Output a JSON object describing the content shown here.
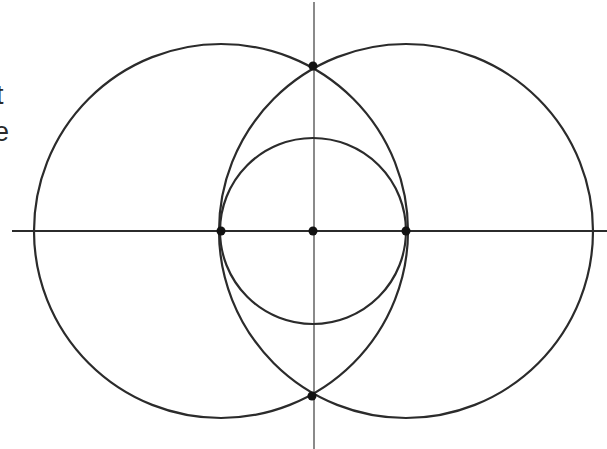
{
  "fragments": {
    "line1": "t",
    "line2": "e"
  },
  "colors": {
    "stroke": "#2b2b2b",
    "axis_vertical": "#8a8a8a",
    "point": "#111111",
    "background": "#ffffff"
  },
  "geometry": {
    "horizontal_axis": {
      "x1": 12,
      "y1": 231,
      "x2": 607,
      "y2": 231
    },
    "vertical_axis": {
      "x1": 314,
      "y1": 2,
      "x2": 314,
      "y2": 449
    },
    "circles": [
      {
        "name": "left-large-circle",
        "cx": 221,
        "cy": 231,
        "r": 187
      },
      {
        "name": "right-large-circle",
        "cx": 406,
        "cy": 231,
        "r": 187
      },
      {
        "name": "center-small-circle",
        "cx": 313,
        "cy": 231,
        "r": 93
      }
    ],
    "points": [
      {
        "name": "point-top-intersection",
        "x": 313,
        "y": 66
      },
      {
        "name": "point-bottom-intersection",
        "x": 312,
        "y": 396
      },
      {
        "name": "point-left-center",
        "x": 221,
        "y": 231
      },
      {
        "name": "point-origin",
        "x": 313,
        "y": 231
      },
      {
        "name": "point-right-center",
        "x": 406,
        "y": 231
      }
    ]
  }
}
